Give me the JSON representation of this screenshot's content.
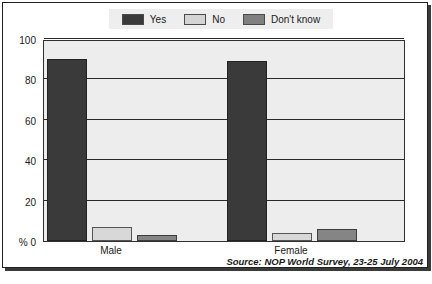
{
  "chart_data": {
    "type": "bar",
    "title": "",
    "subtitle": "",
    "xlabel": "",
    "ylabel": "%",
    "ylim": [
      0,
      100
    ],
    "yticks": [
      0,
      20,
      40,
      60,
      80,
      100
    ],
    "ytick_labels": [
      "% 0",
      "20",
      "40",
      "60",
      "80",
      "100"
    ],
    "grid": true,
    "legend_position": "top-center",
    "categories": [
      "Male",
      "Female"
    ],
    "series": [
      {
        "name": "Yes",
        "color": "#3a3a3a",
        "values": [
          90,
          89
        ]
      },
      {
        "name": "No",
        "color": "#d8d8d8",
        "values": [
          7,
          4
        ]
      },
      {
        "name": "Don't know",
        "color": "#858585",
        "values": [
          3,
          6
        ]
      }
    ],
    "annotations": [
      "Source: NOP World Survey, 23-25 July 2004"
    ]
  },
  "legend": {
    "items": [
      {
        "label": "Yes",
        "swatch": "yes"
      },
      {
        "label": "No",
        "swatch": "no"
      },
      {
        "label": "Don't know",
        "swatch": "dk"
      }
    ]
  },
  "axis": {
    "y_labels": [
      "100",
      "80",
      "60",
      "40",
      "20",
      "% 0"
    ],
    "x_labels": [
      "Male",
      "Female"
    ]
  },
  "footer": {
    "source": "Source: NOP World Survey, 23-25 July 2004"
  }
}
